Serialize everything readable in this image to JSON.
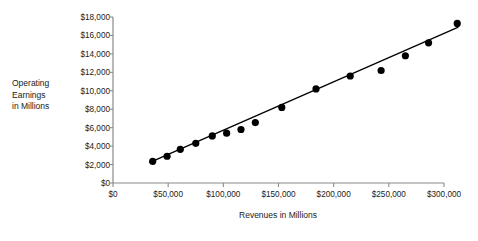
{
  "chart_data": {
    "type": "scatter",
    "title": "",
    "xlabel": "Revenues in Millions",
    "ylabel": "Operating Earnings in Millions",
    "ylabel_lines": [
      "Operating",
      "Earnings",
      "in Millions"
    ],
    "xlim": [
      0,
      300000
    ],
    "ylim": [
      0,
      18000
    ],
    "grid": false,
    "legend": false,
    "x_ticks": [
      0,
      50000,
      100000,
      150000,
      200000,
      250000,
      300000
    ],
    "x_tick_labels": [
      "$0",
      "$50,000",
      "$100,000",
      "$150,000",
      "$200,000",
      "$250,000",
      "$300,000"
    ],
    "y_ticks": [
      0,
      2000,
      4000,
      6000,
      8000,
      10000,
      12000,
      14000,
      16000,
      18000
    ],
    "y_tick_labels": [
      "$0",
      "$2,000",
      "$4,000",
      "$6,000",
      "$8,000",
      "$10,000",
      "$12,000",
      "$14,000",
      "$16,000",
      "$18,000"
    ],
    "marker": "filled-circle",
    "marker_color": "#000000",
    "marker_size": 4.6,
    "points": [
      {
        "x": 36000,
        "y": 2350
      },
      {
        "x": 49000,
        "y": 2900
      },
      {
        "x": 61000,
        "y": 3650
      },
      {
        "x": 75000,
        "y": 4300
      },
      {
        "x": 90000,
        "y": 5100
      },
      {
        "x": 103000,
        "y": 5400
      },
      {
        "x": 116000,
        "y": 5800
      },
      {
        "x": 129000,
        "y": 6550
      },
      {
        "x": 153000,
        "y": 8200
      },
      {
        "x": 184000,
        "y": 10200
      },
      {
        "x": 215000,
        "y": 11600
      },
      {
        "x": 243000,
        "y": 12200
      },
      {
        "x": 265000,
        "y": 13800
      },
      {
        "x": 286000,
        "y": 15200
      },
      {
        "x": 312000,
        "y": 17300
      }
    ],
    "trendline": {
      "shown": true,
      "color": "#000000",
      "x_start": 33000,
      "y_start": 2200,
      "x_end": 313000,
      "y_end": 16900
    },
    "axis_color": "#8a8a8a"
  }
}
